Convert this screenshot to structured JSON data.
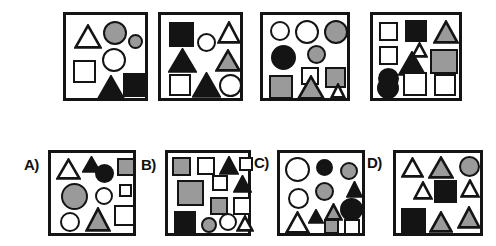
{
  "puzzle": {
    "type": "visual-analogy-shape-matrix",
    "palette": {
      "white": "#ffffff",
      "gray": "#9a9a9a",
      "black": "#141414",
      "outline": "#141414",
      "background": "#ffffff"
    },
    "prompt_row": {
      "name": "problem-row",
      "panels": [
        {
          "id": "problem-1",
          "label": "",
          "box": {
            "x": 63,
            "y": 12,
            "w": 85,
            "h": 89
          },
          "shapes": [
            {
              "kind": "triangle",
              "fill": "white",
              "x": 8,
              "y": 9,
              "w": 28,
              "h": 25
            },
            {
              "kind": "circle",
              "fill": "gray",
              "x": 37,
              "y": 6,
              "w": 24,
              "h": 24
            },
            {
              "kind": "circle",
              "fill": "gray",
              "x": 62,
              "y": 19,
              "w": 15,
              "h": 15
            },
            {
              "kind": "circle",
              "fill": "white",
              "x": 36,
              "y": 33,
              "w": 24,
              "h": 24
            },
            {
              "kind": "square",
              "fill": "white",
              "x": 7,
              "y": 45,
              "w": 23,
              "h": 23
            },
            {
              "kind": "triangle",
              "fill": "black",
              "x": 31,
              "y": 60,
              "w": 28,
              "h": 25
            },
            {
              "kind": "square",
              "fill": "black",
              "x": 57,
              "y": 58,
              "w": 24,
              "h": 24
            }
          ]
        },
        {
          "id": "problem-2",
          "label": "",
          "box": {
            "x": 158,
            "y": 12,
            "w": 85,
            "h": 89
          },
          "shapes": [
            {
              "kind": "square",
              "fill": "black",
              "x": 8,
              "y": 7,
              "w": 25,
              "h": 25
            },
            {
              "kind": "circle",
              "fill": "white",
              "x": 36,
              "y": 18,
              "w": 19,
              "h": 19
            },
            {
              "kind": "triangle",
              "fill": "white",
              "x": 56,
              "y": 6,
              "w": 24,
              "h": 23
            },
            {
              "kind": "triangle",
              "fill": "black",
              "x": 7,
              "y": 33,
              "w": 29,
              "h": 25
            },
            {
              "kind": "triangle",
              "fill": "gray",
              "x": 54,
              "y": 34,
              "w": 26,
              "h": 23
            },
            {
              "kind": "square",
              "fill": "white",
              "x": 8,
              "y": 59,
              "w": 22,
              "h": 22
            },
            {
              "kind": "triangle",
              "fill": "black",
              "x": 31,
              "y": 57,
              "w": 29,
              "h": 26
            },
            {
              "kind": "circle",
              "fill": "white",
              "x": 58,
              "y": 59,
              "w": 23,
              "h": 23
            }
          ]
        },
        {
          "id": "problem-3",
          "label": "",
          "box": {
            "x": 260,
            "y": 12,
            "w": 90,
            "h": 89
          },
          "shapes": [
            {
              "kind": "circle",
              "fill": "white",
              "x": 7,
              "y": 6,
              "w": 20,
              "h": 20
            },
            {
              "kind": "circle",
              "fill": "white",
              "x": 32,
              "y": 5,
              "w": 24,
              "h": 24
            },
            {
              "kind": "circle",
              "fill": "gray",
              "x": 61,
              "y": 5,
              "w": 24,
              "h": 24
            },
            {
              "kind": "circle",
              "fill": "black",
              "x": 8,
              "y": 30,
              "w": 25,
              "h": 25
            },
            {
              "kind": "circle",
              "fill": "gray",
              "x": 44,
              "y": 30,
              "w": 19,
              "h": 19
            },
            {
              "kind": "square",
              "fill": "white",
              "x": 38,
              "y": 52,
              "w": 18,
              "h": 18
            },
            {
              "kind": "square",
              "fill": "gray",
              "x": 62,
              "y": 52,
              "w": 21,
              "h": 21
            },
            {
              "kind": "square",
              "fill": "gray",
              "x": 6,
              "y": 60,
              "w": 24,
              "h": 24
            },
            {
              "kind": "triangle",
              "fill": "gray",
              "x": 34,
              "y": 60,
              "w": 28,
              "h": 25
            },
            {
              "kind": "triangle",
              "fill": "white",
              "x": 67,
              "y": 68,
              "w": 16,
              "h": 16
            }
          ]
        },
        {
          "id": "problem-4",
          "label": "",
          "box": {
            "x": 370,
            "y": 12,
            "w": 92,
            "h": 89
          },
          "shapes": [
            {
              "kind": "square",
              "fill": "white",
              "x": 6,
              "y": 7,
              "w": 19,
              "h": 19
            },
            {
              "kind": "square",
              "fill": "black",
              "x": 32,
              "y": 5,
              "w": 22,
              "h": 22
            },
            {
              "kind": "triangle",
              "fill": "gray",
              "x": 60,
              "y": 5,
              "w": 26,
              "h": 24
            },
            {
              "kind": "square",
              "fill": "white",
              "x": 6,
              "y": 31,
              "w": 19,
              "h": 19
            },
            {
              "kind": "triangle",
              "fill": "white",
              "x": 38,
              "y": 27,
              "w": 17,
              "h": 16
            },
            {
              "kind": "triangle",
              "fill": "black",
              "x": 25,
              "y": 36,
              "w": 28,
              "h": 25
            },
            {
              "kind": "square",
              "fill": "gray",
              "x": 57,
              "y": 34,
              "w": 28,
              "h": 25
            },
            {
              "kind": "circle",
              "fill": "black",
              "x": 5,
              "y": 53,
              "w": 21,
              "h": 21
            },
            {
              "kind": "square",
              "fill": "white",
              "x": 30,
              "y": 57,
              "w": 24,
              "h": 24
            },
            {
              "kind": "square",
              "fill": "white",
              "x": 61,
              "y": 59,
              "w": 22,
              "h": 22
            },
            {
              "kind": "circle",
              "fill": "black",
              "x": 4,
              "y": 62,
              "w": 22,
              "h": 22
            }
          ]
        }
      ]
    },
    "answer_row": {
      "name": "answer-options-row",
      "options": [
        {
          "id": "option-a",
          "label": "A)",
          "label_pos": {
            "x": 24,
            "y": 157
          },
          "box": {
            "x": 48,
            "y": 150,
            "w": 88,
            "h": 86
          },
          "shapes": [
            {
              "kind": "triangle",
              "fill": "white",
              "x": 5,
              "y": 5,
              "w": 25,
              "h": 22
            },
            {
              "kind": "triangle",
              "fill": "black",
              "x": 31,
              "y": 3,
              "w": 19,
              "h": 17
            },
            {
              "kind": "circle",
              "fill": "black",
              "x": 44,
              "y": 11,
              "w": 19,
              "h": 19
            },
            {
              "kind": "square",
              "fill": "gray",
              "x": 66,
              "y": 5,
              "w": 18,
              "h": 18
            },
            {
              "kind": "circle",
              "fill": "gray",
              "x": 10,
              "y": 30,
              "w": 27,
              "h": 27
            },
            {
              "kind": "circle",
              "fill": "white",
              "x": 44,
              "y": 34,
              "w": 18,
              "h": 18
            },
            {
              "kind": "square",
              "fill": "white",
              "x": 68,
              "y": 31,
              "w": 13,
              "h": 13
            },
            {
              "kind": "square",
              "fill": "white",
              "x": 63,
              "y": 52,
              "w": 21,
              "h": 21
            },
            {
              "kind": "circle",
              "fill": "white",
              "x": 9,
              "y": 59,
              "w": 20,
              "h": 20
            },
            {
              "kind": "triangle",
              "fill": "gray",
              "x": 34,
              "y": 54,
              "w": 26,
              "h": 25
            }
          ]
        },
        {
          "id": "option-b",
          "label": "B)",
          "label_pos": {
            "x": 141,
            "y": 157
          },
          "box": {
            "x": 165,
            "y": 150,
            "w": 86,
            "h": 86
          },
          "shapes": [
            {
              "kind": "square",
              "fill": "gray",
              "x": 4,
              "y": 4,
              "w": 19,
              "h": 19
            },
            {
              "kind": "square",
              "fill": "white",
              "x": 29,
              "y": 4,
              "w": 18,
              "h": 18
            },
            {
              "kind": "triangle",
              "fill": "black",
              "x": 51,
              "y": 3,
              "w": 20,
              "h": 19
            },
            {
              "kind": "square",
              "fill": "white",
              "x": 71,
              "y": 4,
              "w": 14,
              "h": 14
            },
            {
              "kind": "square",
              "fill": "gray",
              "x": 9,
              "y": 27,
              "w": 27,
              "h": 26
            },
            {
              "kind": "square",
              "fill": "white",
              "x": 44,
              "y": 22,
              "w": 16,
              "h": 16
            },
            {
              "kind": "triangle",
              "fill": "black",
              "x": 65,
              "y": 22,
              "w": 19,
              "h": 18
            },
            {
              "kind": "square",
              "fill": "gray",
              "x": 42,
              "y": 44,
              "w": 18,
              "h": 18
            },
            {
              "kind": "square",
              "fill": "white",
              "x": 65,
              "y": 44,
              "w": 18,
              "h": 18
            },
            {
              "kind": "square",
              "fill": "black",
              "x": 6,
              "y": 58,
              "w": 22,
              "h": 22
            },
            {
              "kind": "circle",
              "fill": "gray",
              "x": 33,
              "y": 64,
              "w": 16,
              "h": 16
            },
            {
              "kind": "circle",
              "fill": "white",
              "x": 51,
              "y": 60,
              "w": 18,
              "h": 18
            },
            {
              "kind": "triangle",
              "fill": "white",
              "x": 68,
              "y": 62,
              "w": 18,
              "h": 17
            }
          ]
        },
        {
          "id": "option-c",
          "label": "C)",
          "label_pos": {
            "x": 254,
            "y": 155
          },
          "box": {
            "x": 277,
            "y": 150,
            "w": 88,
            "h": 86
          },
          "shapes": [
            {
              "kind": "circle",
              "fill": "white",
              "x": 5,
              "y": 4,
              "w": 25,
              "h": 25
            },
            {
              "kind": "circle",
              "fill": "black",
              "x": 36,
              "y": 6,
              "w": 17,
              "h": 17
            },
            {
              "kind": "circle",
              "fill": "gray",
              "x": 60,
              "y": 9,
              "w": 18,
              "h": 18
            },
            {
              "kind": "circle",
              "fill": "white",
              "x": 8,
              "y": 35,
              "w": 21,
              "h": 21
            },
            {
              "kind": "circle",
              "fill": "gray",
              "x": 35,
              "y": 29,
              "w": 19,
              "h": 19
            },
            {
              "kind": "triangle",
              "fill": "black",
              "x": 66,
              "y": 28,
              "w": 17,
              "h": 17
            },
            {
              "kind": "circle",
              "fill": "black",
              "x": 60,
              "y": 45,
              "w": 23,
              "h": 23
            },
            {
              "kind": "triangle",
              "fill": "white",
              "x": 5,
              "y": 58,
              "w": 25,
              "h": 23
            },
            {
              "kind": "triangle",
              "fill": "black",
              "x": 28,
              "y": 56,
              "w": 16,
              "h": 15
            },
            {
              "kind": "triangle",
              "fill": "gray",
              "x": 44,
              "y": 50,
              "w": 19,
              "h": 18
            },
            {
              "kind": "square",
              "fill": "gray",
              "x": 44,
              "y": 66,
              "w": 15,
              "h": 15
            },
            {
              "kind": "square",
              "fill": "white",
              "x": 64,
              "y": 66,
              "w": 16,
              "h": 16
            }
          ]
        },
        {
          "id": "option-d",
          "label": "D)",
          "label_pos": {
            "x": 367,
            "y": 155
          },
          "box": {
            "x": 393,
            "y": 150,
            "w": 90,
            "h": 86
          },
          "shapes": [
            {
              "kind": "triangle",
              "fill": "white",
              "x": 5,
              "y": 4,
              "w": 23,
              "h": 21
            },
            {
              "kind": "triangle",
              "fill": "gray",
              "x": 32,
              "y": 3,
              "w": 26,
              "h": 23
            },
            {
              "kind": "circle",
              "fill": "gray",
              "x": 63,
              "y": 3,
              "w": 21,
              "h": 21
            },
            {
              "kind": "triangle",
              "fill": "white",
              "x": 17,
              "y": 28,
              "w": 20,
              "h": 19
            },
            {
              "kind": "square",
              "fill": "black",
              "x": 38,
              "y": 27,
              "w": 23,
              "h": 23
            },
            {
              "kind": "triangle",
              "fill": "white",
              "x": 64,
              "y": 26,
              "w": 20,
              "h": 19
            },
            {
              "kind": "square",
              "fill": "black",
              "x": 5,
              "y": 55,
              "w": 25,
              "h": 25
            },
            {
              "kind": "triangle",
              "fill": "gray",
              "x": 33,
              "y": 58,
              "w": 24,
              "h": 22
            },
            {
              "kind": "triangle",
              "fill": "gray",
              "x": 61,
              "y": 53,
              "w": 24,
              "h": 23
            }
          ]
        }
      ]
    }
  }
}
